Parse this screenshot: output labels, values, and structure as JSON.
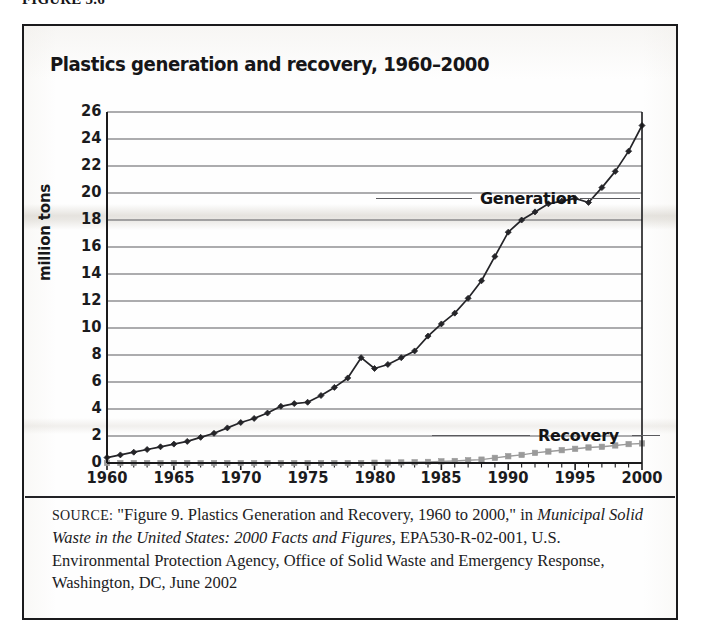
{
  "figure_label": "FIGURE 5.6",
  "chart": {
    "title": "Plastics generation and recovery, 1960–2000",
    "ylabel": "million tons",
    "series_labels": {
      "generation": "Generation",
      "recovery": "Recovery"
    }
  },
  "source": {
    "kicker": "SOURCE:",
    "line1": "\"Figure 9. Plastics Generation and Recovery, 1960 to 2000,\" in",
    "italic_title": "Municipal Solid Waste in the United States: 2000 Facts and Figures,",
    "line3": "EPA530-R-02-001, U.S. Environmental Protection Agency, Office of",
    "line4": "Solid Waste and Emergency Response, Washington, DC, June 2002"
  },
  "colors": {
    "generation_line": "#242428",
    "recovery_line": "#9a9a9a",
    "gridline": "#5a5a5e",
    "axis": "#1a1a1c",
    "frame": "#1a1a1c",
    "text": "#1b1b1d",
    "background": "#fefefe"
  },
  "chart_data": {
    "type": "line",
    "title": "Plastics generation and recovery, 1960–2000",
    "xlabel": "",
    "ylabel": "million tons",
    "xlim": [
      1960,
      2000
    ],
    "ylim": [
      0,
      26
    ],
    "ytick_values": [
      0,
      2,
      4,
      6,
      8,
      10,
      12,
      14,
      16,
      18,
      20,
      22,
      24,
      26
    ],
    "ytick_labels": [
      "0",
      "2",
      "4",
      "6",
      "8",
      "10",
      "12",
      "14",
      "16",
      "18",
      "20",
      "22",
      "24",
      "26"
    ],
    "xtick_labels": [
      "1960",
      "1965",
      "1970",
      "1975",
      "1980",
      "1985",
      "1990",
      "1995",
      "2000"
    ],
    "xtick_values": [
      1960,
      1965,
      1970,
      1975,
      1980,
      1985,
      1990,
      1995,
      2000
    ],
    "minor_xticks_every": 1,
    "grid": "horizontal",
    "legend": "inline-annotations",
    "x": [
      1960,
      1961,
      1962,
      1963,
      1964,
      1965,
      1966,
      1967,
      1968,
      1969,
      1970,
      1971,
      1972,
      1973,
      1974,
      1975,
      1976,
      1977,
      1978,
      1979,
      1980,
      1981,
      1982,
      1983,
      1984,
      1985,
      1986,
      1987,
      1988,
      1989,
      1990,
      1991,
      1992,
      1993,
      1994,
      1995,
      1996,
      1997,
      1998,
      1999,
      2000
    ],
    "series": [
      {
        "name": "Generation",
        "marker": "diamond",
        "color": "#242428",
        "values": [
          0.4,
          0.6,
          0.8,
          1.0,
          1.2,
          1.4,
          1.6,
          1.9,
          2.2,
          2.6,
          3.0,
          3.3,
          3.7,
          4.2,
          4.4,
          4.5,
          5.0,
          5.6,
          6.3,
          7.8,
          7.0,
          7.3,
          7.8,
          8.3,
          9.4,
          10.3,
          11.1,
          12.2,
          13.5,
          15.3,
          17.1,
          18.0,
          18.6,
          19.2,
          19.4,
          19.6,
          19.3,
          20.4,
          21.6,
          23.1,
          25.0
        ]
      },
      {
        "name": "Recovery",
        "marker": "square",
        "color": "#9a9a9a",
        "values": [
          0.0,
          0.0,
          0.0,
          0.0,
          0.0,
          0.0,
          0.0,
          0.0,
          0.0,
          0.0,
          0.0,
          0.0,
          0.0,
          0.0,
          0.0,
          0.0,
          0.0,
          0.0,
          0.0,
          0.0,
          0.02,
          0.03,
          0.04,
          0.05,
          0.08,
          0.12,
          0.15,
          0.2,
          0.25,
          0.38,
          0.5,
          0.6,
          0.75,
          0.85,
          0.95,
          1.05,
          1.15,
          1.2,
          1.3,
          1.4,
          1.45
        ]
      }
    ]
  }
}
